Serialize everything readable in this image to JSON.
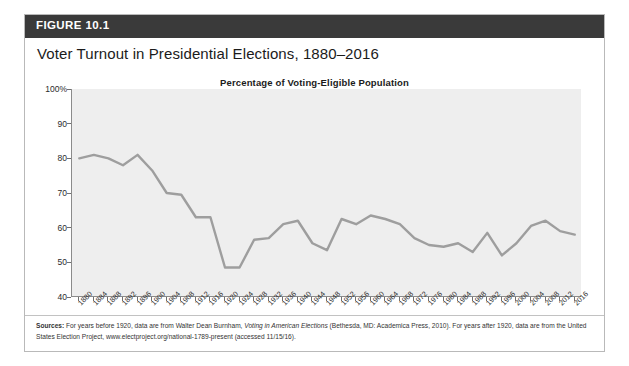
{
  "figure": {
    "label": "FIGURE 10.1",
    "title": "Voter Turnout in Presidential Elections, 1880–2016",
    "header_bg": "#3a3a3a",
    "header_text_color": "#ffffff"
  },
  "sources": {
    "heading": "Sources:",
    "line1_a": " For years before 1920, data are from Walter Dean Burnham, ",
    "line1_italic": "Voting in American Elections",
    "line1_b": " (Bethesda, MD: Academica Press, 2010). For years after",
    "line2": "1920, data are from the United States Election Project, www.electproject.org/national-1789-present (accessed 11/15/16)."
  },
  "chart_data": {
    "type": "line",
    "title": "Percentage of Voting-Eligible Population",
    "subtitle": "Percentage of Voting-Eligible Population",
    "xlabel": "",
    "ylabel": "",
    "ylim": [
      40,
      100
    ],
    "yticks": [
      40,
      50,
      60,
      70,
      80,
      90,
      100
    ],
    "ytick_labels": [
      "40",
      "50",
      "60",
      "70",
      "80",
      "90",
      "100%"
    ],
    "grid": false,
    "legend": "none",
    "line_color": "#9e9e9e",
    "plot_bg": "#eeeeee",
    "categories": [
      "1880",
      "1884",
      "1888",
      "1892",
      "1896",
      "1900",
      "1904",
      "1908",
      "1912",
      "1916",
      "1920",
      "1924",
      "1928",
      "1932",
      "1936",
      "1940",
      "1944",
      "1948",
      "1952",
      "1956",
      "1960",
      "1964",
      "1968",
      "1972",
      "1976",
      "1980",
      "1984",
      "1988",
      "1992",
      "1996",
      "2000",
      "2004",
      "2008",
      "2012",
      "2016"
    ],
    "values": [
      80.0,
      81.0,
      80.0,
      78.0,
      81.0,
      76.5,
      70.0,
      69.5,
      63.0,
      63.0,
      48.5,
      48.5,
      56.5,
      57.0,
      61.0,
      62.0,
      55.5,
      53.5,
      62.5,
      61.0,
      63.5,
      62.5,
      61.0,
      57.0,
      55.0,
      54.5,
      55.5,
      53.0,
      58.5,
      52.0,
      55.5,
      60.5,
      62.0,
      59.0,
      58.0
    ]
  }
}
